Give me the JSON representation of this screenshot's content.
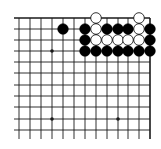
{
  "diagram": {
    "type": "go-board-corner",
    "region": "top-right",
    "colors": {
      "line": "#1a1a1a",
      "black_stone": "#000000",
      "white_stone": "#ffffff",
      "background": "#ffffff"
    },
    "grid": {
      "columns_x": [
        19,
        30,
        41,
        52,
        63,
        74,
        85,
        96,
        107,
        118,
        128,
        139,
        150
      ],
      "rows_y": [
        18,
        29,
        40,
        51,
        62,
        73,
        85,
        96,
        107,
        119,
        130
      ],
      "left_overhang_x": 14,
      "bottom_overhang_y": 139
    },
    "star_points": [
      {
        "col": 3,
        "row": 3
      },
      {
        "col": 3,
        "row": 9
      },
      {
        "col": 9,
        "row": 9
      }
    ],
    "stones": [
      {
        "color": "white",
        "col": 7,
        "row": 0
      },
      {
        "color": "white",
        "col": 11,
        "row": 0
      },
      {
        "color": "black",
        "col": 4,
        "row": 1
      },
      {
        "color": "black",
        "col": 6,
        "row": 1
      },
      {
        "color": "white",
        "col": 7,
        "row": 1
      },
      {
        "color": "black",
        "col": 8,
        "row": 1
      },
      {
        "color": "black",
        "col": 9,
        "row": 1
      },
      {
        "color": "black",
        "col": 10,
        "row": 1
      },
      {
        "color": "white",
        "col": 11,
        "row": 1
      },
      {
        "color": "black",
        "col": 12,
        "row": 1
      },
      {
        "color": "black",
        "col": 6,
        "row": 2
      },
      {
        "color": "white",
        "col": 7,
        "row": 2
      },
      {
        "color": "white",
        "col": 8,
        "row": 2
      },
      {
        "color": "white",
        "col": 9,
        "row": 2
      },
      {
        "color": "white",
        "col": 10,
        "row": 2
      },
      {
        "color": "white",
        "col": 11,
        "row": 2
      },
      {
        "color": "black",
        "col": 12,
        "row": 2
      },
      {
        "color": "black",
        "col": 6,
        "row": 3
      },
      {
        "color": "black",
        "col": 7,
        "row": 3
      },
      {
        "color": "black",
        "col": 8,
        "row": 3
      },
      {
        "color": "black",
        "col": 9,
        "row": 3
      },
      {
        "color": "black",
        "col": 10,
        "row": 3
      },
      {
        "color": "black",
        "col": 11,
        "row": 3
      },
      {
        "color": "black",
        "col": 12,
        "row": 3
      }
    ]
  }
}
